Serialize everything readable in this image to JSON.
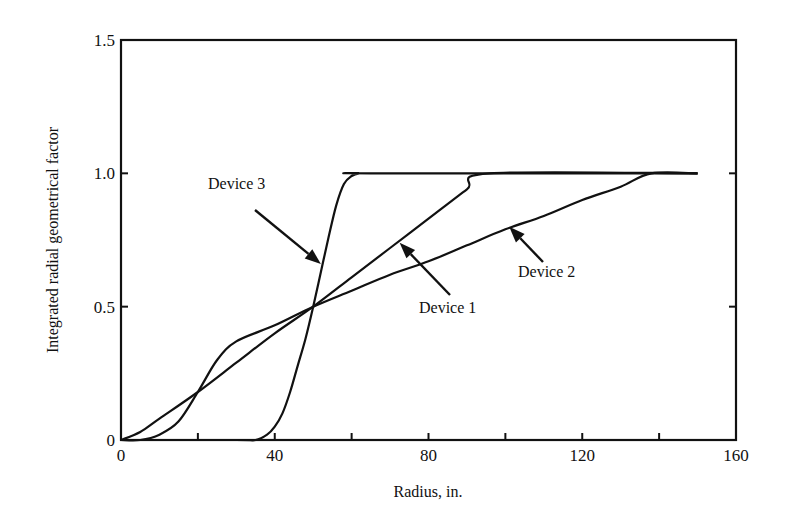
{
  "chart_data": {
    "type": "line",
    "title": "",
    "xlabel": "Radius, in.",
    "ylabel": "Integrated radial geometrical factor",
    "xlim": [
      0,
      160
    ],
    "ylim": [
      0,
      1.5
    ],
    "xticks": [
      0,
      20,
      40,
      60,
      80,
      100,
      120,
      140,
      160
    ],
    "xtick_labels": [
      "0",
      "",
      "40",
      "",
      "80",
      "",
      "120",
      "",
      "160"
    ],
    "yticks": [
      0,
      0.5,
      1.0,
      1.5
    ],
    "ytick_labels": [
      "0",
      "0.5",
      "1.0",
      "1.5"
    ],
    "grid": false,
    "legend": null,
    "series": [
      {
        "name": "Device 1",
        "x": [
          0,
          5,
          10,
          20,
          30,
          40,
          50,
          60,
          70,
          80,
          90,
          96,
          150
        ],
        "y": [
          0,
          0.03,
          0.08,
          0.18,
          0.29,
          0.4,
          0.5,
          0.61,
          0.72,
          0.83,
          0.94,
          1.0,
          1.0
        ]
      },
      {
        "name": "Device 2",
        "x": [
          0,
          5,
          10,
          15,
          20,
          25,
          30,
          40,
          50,
          60,
          70,
          80,
          90,
          100,
          110,
          120,
          130,
          138,
          150
        ],
        "y": [
          0,
          0.0,
          0.02,
          0.07,
          0.18,
          0.3,
          0.37,
          0.43,
          0.5,
          0.56,
          0.62,
          0.67,
          0.73,
          0.79,
          0.84,
          0.9,
          0.95,
          1.0,
          1.0
        ]
      },
      {
        "name": "Device 3",
        "x": [
          0,
          30,
          35,
          38,
          40,
          42,
          44,
          46,
          48,
          50,
          52,
          54,
          56,
          58,
          60,
          62,
          65,
          150
        ],
        "y": [
          0,
          0,
          0.0,
          0.02,
          0.05,
          0.1,
          0.18,
          0.28,
          0.38,
          0.5,
          0.63,
          0.76,
          0.88,
          0.96,
          0.99,
          1.0,
          1.0,
          1.0
        ]
      }
    ],
    "annotations": [
      {
        "text": "Device 3",
        "arrow_to": [
          52,
          0.66
        ]
      },
      {
        "text": "Device 1",
        "arrow_to": [
          72,
          0.74
        ]
      },
      {
        "text": "Device 2",
        "arrow_to": [
          101,
          0.8
        ]
      }
    ]
  },
  "labels": {
    "xlabel": "Radius, in.",
    "ylabel": "Integrated radial geometrical factor",
    "device1": "Device 1",
    "device2": "Device 2",
    "device3": "Device 3"
  }
}
